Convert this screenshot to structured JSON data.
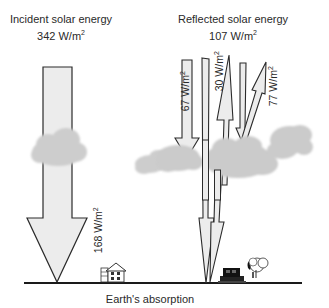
{
  "title_incident": {
    "line1": "Incident solar energy",
    "value": "342 W/m",
    "exp": "2"
  },
  "title_reflected": {
    "line1": "Reflected solar energy",
    "value": "107 W/m",
    "exp": "2"
  },
  "arrows": [
    {
      "id": "incident",
      "direction": "down",
      "value": "168 W/m",
      "exp": "2",
      "meaning": "absorbed by surface"
    },
    {
      "id": "cloud-reflect",
      "direction": "up",
      "value": "67 W/m",
      "exp": "2"
    },
    {
      "id": "atmos-reflect",
      "direction": "up",
      "value": "30 W/m",
      "exp": "2"
    },
    {
      "id": "surface-reflect",
      "direction": "up",
      "value": "77 W/m",
      "exp": "2"
    }
  ],
  "footer": {
    "label": "Earth's absorption"
  },
  "colors": {
    "arrow_fill": "#ebebeb",
    "arrow_stroke": "#2b2b2b",
    "cloud": "#cfcfcf",
    "ground": "#1a1a1a"
  },
  "icons": [
    "cloud-icon",
    "house-icon",
    "car-icon",
    "tree-icon"
  ]
}
